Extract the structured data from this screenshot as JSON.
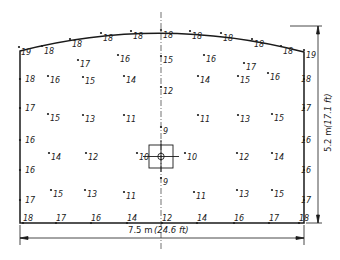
{
  "diagram": {
    "type": "illuminance-distribution-plan",
    "colors": {
      "line": "#1a1a1a",
      "text": "#222222",
      "background": "#ffffff"
    },
    "dimensions": {
      "width_label_m": "7.5 m",
      "width_label_ft": "(24.6 ft)",
      "height_label_m": "5.2 m",
      "height_label_ft": "(17.1 ft)"
    },
    "luminaire": {
      "symbol": "circle-in-square",
      "label": "central luminaire"
    },
    "top_edge_values": [
      {
        "x": 19,
        "y": 52,
        "v": "19"
      },
      {
        "x": 42,
        "y": 51,
        "v": "18"
      },
      {
        "x": 70,
        "y": 44,
        "v": "18"
      },
      {
        "x": 101,
        "y": 38,
        "v": "18"
      },
      {
        "x": 131,
        "y": 36,
        "v": "18"
      },
      {
        "x": 161,
        "y": 35,
        "v": "18"
      },
      {
        "x": 190,
        "y": 36,
        "v": "18"
      },
      {
        "x": 221,
        "y": 38,
        "v": "18"
      },
      {
        "x": 252,
        "y": 44,
        "v": "18"
      },
      {
        "x": 281,
        "y": 51,
        "v": "18"
      },
      {
        "x": 304,
        "y": 55,
        "v": "19"
      }
    ],
    "left_edge_values": [
      {
        "x": 23,
        "y": 79,
        "v": "18"
      },
      {
        "x": 23,
        "y": 108,
        "v": "17"
      },
      {
        "x": 23,
        "y": 140,
        "v": "16"
      },
      {
        "x": 23,
        "y": 170,
        "v": "16"
      },
      {
        "x": 23,
        "y": 200,
        "v": "17"
      }
    ],
    "right_edge_values": [
      {
        "x": 299,
        "y": 79,
        "v": "18"
      },
      {
        "x": 299,
        "y": 108,
        "v": "17"
      },
      {
        "x": 299,
        "y": 140,
        "v": "16"
      },
      {
        "x": 299,
        "y": 170,
        "v": "16"
      },
      {
        "x": 299,
        "y": 200,
        "v": "17"
      }
    ],
    "bottom_edge_values": [
      {
        "x": 21,
        "y": 218,
        "v": "18"
      },
      {
        "x": 54,
        "y": 218,
        "v": "17"
      },
      {
        "x": 89,
        "y": 218,
        "v": "16"
      },
      {
        "x": 125,
        "y": 218,
        "v": "14"
      },
      {
        "x": 160,
        "y": 218,
        "v": "12"
      },
      {
        "x": 195,
        "y": 218,
        "v": "14"
      },
      {
        "x": 232,
        "y": 218,
        "v": "16"
      },
      {
        "x": 267,
        "y": 218,
        "v": "17"
      },
      {
        "x": 297,
        "y": 218,
        "v": "18"
      }
    ],
    "interior_values": [
      {
        "x": 78,
        "y": 64,
        "v": "17"
      },
      {
        "x": 118,
        "y": 59,
        "v": "16"
      },
      {
        "x": 161,
        "y": 60,
        "v": "15"
      },
      {
        "x": 204,
        "y": 59,
        "v": "16"
      },
      {
        "x": 244,
        "y": 67,
        "v": "17"
      },
      {
        "x": 48,
        "y": 80,
        "v": "16"
      },
      {
        "x": 83,
        "y": 81,
        "v": "15"
      },
      {
        "x": 124,
        "y": 80,
        "v": "14"
      },
      {
        "x": 161,
        "y": 91,
        "v": "12"
      },
      {
        "x": 198,
        "y": 80,
        "v": "14"
      },
      {
        "x": 238,
        "y": 80,
        "v": "15"
      },
      {
        "x": 268,
        "y": 77,
        "v": "16"
      },
      {
        "x": 48,
        "y": 118,
        "v": "15"
      },
      {
        "x": 83,
        "y": 119,
        "v": "13"
      },
      {
        "x": 124,
        "y": 119,
        "v": "11"
      },
      {
        "x": 161,
        "y": 131,
        "v": "9"
      },
      {
        "x": 198,
        "y": 119,
        "v": "11"
      },
      {
        "x": 238,
        "y": 119,
        "v": "13"
      },
      {
        "x": 272,
        "y": 118,
        "v": "15"
      },
      {
        "x": 49,
        "y": 157,
        "v": "14"
      },
      {
        "x": 86,
        "y": 157,
        "v": "12"
      },
      {
        "x": 137,
        "y": 157,
        "v": "10"
      },
      {
        "x": 185,
        "y": 157,
        "v": "10"
      },
      {
        "x": 237,
        "y": 157,
        "v": "12"
      },
      {
        "x": 272,
        "y": 157,
        "v": "14"
      },
      {
        "x": 161,
        "y": 182,
        "v": "9"
      },
      {
        "x": 51,
        "y": 194,
        "v": "15"
      },
      {
        "x": 85,
        "y": 194,
        "v": "13"
      },
      {
        "x": 124,
        "y": 196,
        "v": "11"
      },
      {
        "x": 194,
        "y": 196,
        "v": "11"
      },
      {
        "x": 237,
        "y": 194,
        "v": "13"
      },
      {
        "x": 272,
        "y": 194,
        "v": "15"
      }
    ]
  }
}
